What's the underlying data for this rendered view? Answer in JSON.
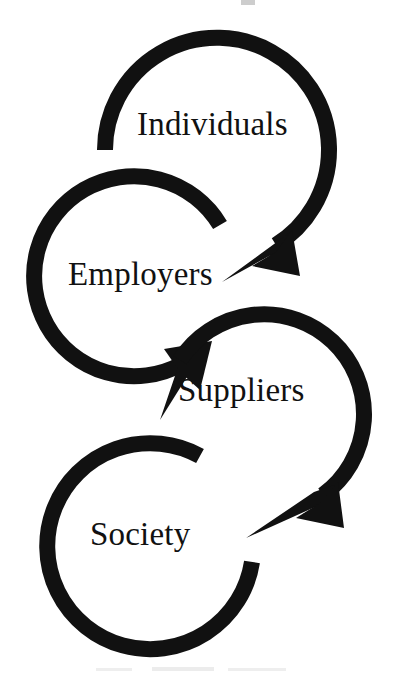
{
  "document": {
    "type": "diagram",
    "title": "Stakeholder Cascade",
    "background_color": "#ffffff",
    "ink_color": "#111111",
    "width": 393,
    "height": 677
  },
  "diagram": {
    "style": "circular-arrow-cascade",
    "stroke_color": "#111111",
    "stroke_width": 16,
    "nodes": [
      {
        "id": "individuals",
        "label": "Individuals",
        "order": 1,
        "center_x": 217,
        "center_y": 150,
        "radius": 112,
        "ring_kind": "arrow",
        "start_angle_deg": 180,
        "end_angle_deg": 122,
        "sweep": "clockwise",
        "has_arrowhead": true,
        "arrow_tip_x": 222,
        "arrow_tip_y": 282,
        "arrow_direction": "down-left",
        "points_to": "employers"
      },
      {
        "id": "employers",
        "label": "Employers",
        "order": 2,
        "center_x": 140,
        "center_y": 285,
        "radius": 100,
        "ring_kind": "arrow",
        "start_angle_deg": 323,
        "end_angle_deg": 37,
        "sweep": "counter-clockwise",
        "has_arrowhead": true,
        "arrow_tip_x": 160,
        "arrow_tip_y": 420,
        "arrow_direction": "down-right",
        "points_to": "suppliers"
      },
      {
        "id": "suppliers",
        "label": "Suppliers",
        "order": 3,
        "center_x": 262,
        "center_y": 418,
        "radius": 100,
        "ring_kind": "arrow",
        "start_angle_deg": 215,
        "end_angle_deg": 128,
        "sweep": "clockwise",
        "has_arrowhead": true,
        "arrow_tip_x": 246,
        "arrow_tip_y": 538,
        "arrow_direction": "down-left",
        "points_to": "society"
      },
      {
        "id": "society",
        "label": "Society",
        "order": 4,
        "center_x": 148,
        "center_y": 545,
        "radius": 103,
        "ring_kind": "open-ring",
        "start_angle_deg": 300,
        "end_angle_deg": 275,
        "sweep": "counter-clockwise",
        "has_arrowhead": false,
        "arrow_direction": "none",
        "points_to": null
      }
    ],
    "flow_sequence": [
      "Individuals",
      "Employers",
      "Suppliers",
      "Society"
    ]
  },
  "artifacts": {
    "note": "faint scanner specks along top and bottom margins",
    "items": [
      "speck-top",
      "speck-bottom-a",
      "speck-bottom-b",
      "speck-bottom-c"
    ]
  }
}
